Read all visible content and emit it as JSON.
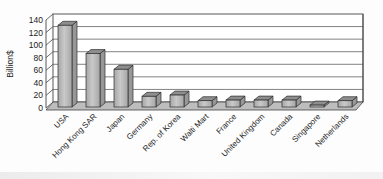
{
  "chart_data": {
    "type": "bar",
    "style": "3d",
    "title": "",
    "ylabel": "Billion$",
    "xlabel": "",
    "categories": [
      "USA",
      "Hong Kong SAR",
      "Japan",
      "Germany",
      "Rep. of Korea",
      "Walti Mart",
      "France",
      "United Kingdom",
      "Canada",
      "Singapore",
      "Netherlands"
    ],
    "values": [
      130,
      85,
      60,
      17,
      19,
      10,
      11,
      11,
      11,
      3,
      10
    ],
    "ylim": [
      0,
      140
    ],
    "ytick_step": 20,
    "yticks": [
      0,
      20,
      40,
      60,
      80,
      100,
      120,
      140
    ],
    "grid": true,
    "legend": false,
    "category_label_rotation_deg": 45
  },
  "colors": {
    "background": "#fdfdfd",
    "wall_fill": "#ffffff",
    "line": "#454545",
    "gridline": "#4a4a4a",
    "floor_fill": "#bdbdbd",
    "bar_front_light": "#c9c9c9",
    "bar_front_dark": "#a6a6a6",
    "bar_top": "#8e8e8e",
    "bar_side": "#979797",
    "bar_outline": "#2e2e2e",
    "text": "#1c1c1c"
  }
}
